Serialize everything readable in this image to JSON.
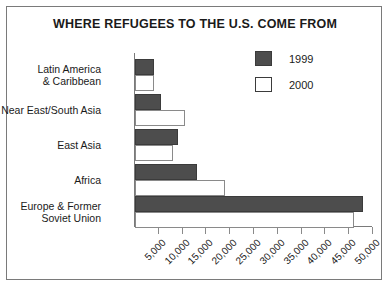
{
  "chart_data": {
    "type": "bar",
    "orientation": "horizontal",
    "title": "WHERE REFUGEES TO THE U.S. COME FROM",
    "xlabel": "",
    "ylabel": "",
    "xlim": [
      0,
      50000
    ],
    "grid": false,
    "legend_position": "top-right",
    "categories": [
      "Latin America\n& Caribbean",
      "Near East/South Asia",
      "East Asia",
      "Africa",
      "Europe & Former\nSoviet Union"
    ],
    "category_lines": [
      [
        "Latin America",
        "& Caribbean"
      ],
      [
        "Near East/South Asia"
      ],
      [
        "East Asia"
      ],
      [
        "Africa"
      ],
      [
        "Europe & Former",
        "Soviet Union"
      ]
    ],
    "series": [
      {
        "name": "1999",
        "color": "#4d4d4d",
        "values": [
          4000,
          5500,
          9000,
          13000,
          48000
        ]
      },
      {
        "name": "2000",
        "color": "#ffffff",
        "values": [
          4000,
          10500,
          8000,
          19000,
          46000
        ]
      }
    ],
    "xticks": [
      5000,
      10000,
      15000,
      20000,
      25000,
      30000,
      35000,
      40000,
      45000,
      50000
    ],
    "xtick_labels": [
      "5,000",
      "10,000",
      "15,000",
      "20,000",
      "25,000",
      "30,000",
      "35,000",
      "40,000",
      "45,000",
      "50,000"
    ]
  },
  "legend": {
    "items": [
      {
        "label": "1999",
        "swatch": "filled-dark-square"
      },
      {
        "label": "2000",
        "swatch": "outlined-white-square"
      }
    ]
  }
}
